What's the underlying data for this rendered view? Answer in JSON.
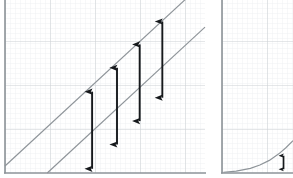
{
  "figure": {
    "title": "",
    "background_color": "#ffffff",
    "grid_minor_color": "#eceff1",
    "grid_major_color": "#c9cdd2",
    "axis_color": "#8d9398",
    "curve_color": "#8e9499",
    "arrow_color": "#16191c"
  },
  "chart_data": [
    {
      "id": "left-panel",
      "type": "line",
      "title": "",
      "xlabel": "",
      "ylabel": "",
      "xlim": [
        0,
        45
      ],
      "ylim": [
        0,
        37
      ],
      "grid": true,
      "grid_minor_step": 1,
      "grid_major_step": 9,
      "legend": "none",
      "series": [
        {
          "name": "upper-line",
          "type": "line",
          "x": [
            0,
            45
          ],
          "y": [
            1.5,
            41.0
          ],
          "color": "#8e9499",
          "width": 1
        },
        {
          "name": "lower-line",
          "type": "line",
          "x": [
            9.5,
            45
          ],
          "y": [
            0.0,
            31.2
          ],
          "color": "#8e9499",
          "width": 1
        }
      ],
      "annotations": [
        {
          "name": "gap-arrow-1",
          "type": "double-arrow",
          "x": 19.6,
          "y_top": 17.4,
          "y_bottom": 0.9,
          "length": 16.5,
          "color": "#16191c"
        },
        {
          "name": "gap-arrow-2",
          "type": "double-arrow",
          "x": 25.2,
          "y_top": 22.5,
          "y_bottom": 6.1,
          "length": 16.4,
          "color": "#16191c"
        },
        {
          "name": "gap-arrow-3",
          "type": "double-arrow",
          "x": 30.3,
          "y_top": 27.5,
          "y_bottom": 11.1,
          "length": 16.4,
          "color": "#16191c"
        },
        {
          "name": "gap-arrow-4",
          "type": "double-arrow",
          "x": 35.4,
          "y_top": 32.4,
          "y_bottom": 16.1,
          "length": 16.3,
          "color": "#16191c"
        }
      ]
    },
    {
      "id": "right-panel",
      "type": "line",
      "title": "",
      "xlabel": "",
      "ylabel": "",
      "xlim": [
        0,
        15
      ],
      "ylim": [
        0,
        37
      ],
      "grid": true,
      "grid_minor_step": 1,
      "grid_major_step": 9,
      "legend": "none",
      "series": [
        {
          "name": "exponential-curve",
          "type": "line",
          "x": [
            0.3,
            3,
            6,
            8,
            10,
            12,
            13.5,
            15
          ],
          "y": [
            0.15,
            0.4,
            1.0,
            1.7,
            2.7,
            4.1,
            5.4,
            6.9
          ],
          "color": "#8e9499",
          "width": 1
        }
      ],
      "annotations": [
        {
          "name": "gap-arrow-small",
          "type": "double-arrow",
          "x": 13.0,
          "y_top": 3.7,
          "y_bottom": 0.8,
          "length": 2.9,
          "color": "#16191c"
        }
      ]
    }
  ]
}
